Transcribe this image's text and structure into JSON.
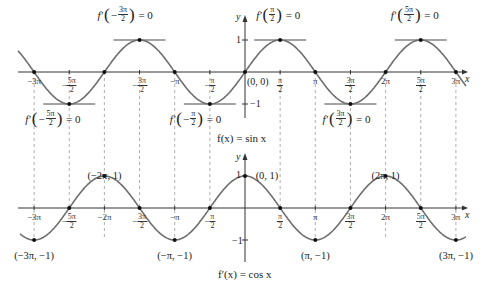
{
  "figure": {
    "top_graph": {
      "function_label": "f(x) = sin x",
      "axis_x": "x",
      "axis_y": "y",
      "y_ticks": [
        "1",
        "−1"
      ],
      "origin_label": "(0, 0)",
      "x_ticks": [
        {
          "sign": "−",
          "num": "",
          "den": "",
          "text": "−3π"
        },
        {
          "sign": "−",
          "num": "5π",
          "den": "2",
          "text": ""
        },
        {
          "sign": "−",
          "num": "3π",
          "den": "2",
          "text": ""
        },
        {
          "sign": "",
          "num": "",
          "den": "",
          "text": "−π"
        },
        {
          "sign": "−",
          "num": "π",
          "den": "2",
          "text": ""
        },
        {
          "sign": "",
          "num": "π",
          "den": "2",
          "text": ""
        },
        {
          "sign": "",
          "num": "",
          "den": "",
          "text": "π"
        },
        {
          "sign": "",
          "num": "3π",
          "den": "2",
          "text": ""
        },
        {
          "sign": "",
          "num": "",
          "den": "",
          "text": "2π"
        },
        {
          "sign": "",
          "num": "5π",
          "den": "2",
          "text": ""
        },
        {
          "sign": "",
          "num": "",
          "den": "",
          "text": "3π"
        }
      ],
      "derivative_annotations": [
        {
          "prefix": "f′",
          "sign": "−",
          "num": "3π",
          "den": "2",
          "suffix": "= 0"
        },
        {
          "prefix": "f′",
          "sign": "−",
          "num": "5π",
          "den": "2",
          "suffix": "= 0"
        },
        {
          "prefix": "f′",
          "sign": "−",
          "num": "π",
          "den": "2",
          "suffix": "= 0"
        },
        {
          "prefix": "f′",
          "sign": "",
          "num": "π",
          "den": "2",
          "suffix": "= 0"
        },
        {
          "prefix": "f′",
          "sign": "",
          "num": "3π",
          "den": "2",
          "suffix": "= 0"
        },
        {
          "prefix": "f′",
          "sign": "",
          "num": "5π",
          "den": "2",
          "suffix": "= 0"
        }
      ]
    },
    "bottom_graph": {
      "function_label": "f′(x) = cos x",
      "axis_x": "x",
      "axis_y": "y",
      "y_ticks": [
        "1",
        "−1"
      ],
      "x_ticks": [
        {
          "sign": "",
          "num": "",
          "den": "",
          "text": "−3π"
        },
        {
          "sign": "−",
          "num": "5π",
          "den": "2",
          "text": ""
        },
        {
          "sign": "",
          "num": "",
          "den": "",
          "text": "−2π"
        },
        {
          "sign": "−",
          "num": "3π",
          "den": "2",
          "text": ""
        },
        {
          "sign": "",
          "num": "",
          "den": "",
          "text": "−π"
        },
        {
          "sign": "−",
          "num": "π",
          "den": "2",
          "text": ""
        },
        {
          "sign": "",
          "num": "π",
          "den": "2",
          "text": ""
        },
        {
          "sign": "",
          "num": "",
          "den": "",
          "text": "π"
        },
        {
          "sign": "",
          "num": "3π",
          "den": "2",
          "text": ""
        },
        {
          "sign": "",
          "num": "",
          "den": "",
          "text": "2π"
        },
        {
          "sign": "",
          "num": "5π",
          "den": "2",
          "text": ""
        },
        {
          "sign": "",
          "num": "",
          "den": "",
          "text": "3π"
        }
      ],
      "point_labels": [
        "(−2π, 1)",
        "(0, 1)",
        "(2π, 1)",
        "(−3π, −1)",
        "(−π, −1)",
        "(π, −1)",
        "(3π, −1)"
      ]
    },
    "colors": {
      "curve": "#6e6e6e",
      "axis": "#333333",
      "dashed": "#9a9a9a",
      "point": "#111111",
      "background": "#ffffff"
    }
  }
}
